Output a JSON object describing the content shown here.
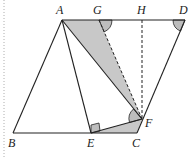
{
  "diagram": {
    "points": {
      "A": {
        "label": "A",
        "x": 62,
        "y": 20
      },
      "G": {
        "label": "G",
        "x": 99,
        "y": 20
      },
      "H": {
        "label": "H",
        "x": 142,
        "y": 20
      },
      "D": {
        "label": "D",
        "x": 185,
        "y": 20
      },
      "B": {
        "label": "B",
        "x": 13,
        "y": 133
      },
      "E": {
        "label": "E",
        "x": 91,
        "y": 133
      },
      "C": {
        "label": "C",
        "x": 137,
        "y": 133
      },
      "F": {
        "label": "F",
        "x": 142,
        "y": 119
      }
    },
    "labels": {
      "A": "A",
      "G": "G",
      "H": "H",
      "D": "D",
      "B": "B",
      "E": "E",
      "C": "C",
      "F": "F"
    },
    "colors": {
      "line": "#222222",
      "shade": "#c8c8c8",
      "angle_mark": "#bdbdbd"
    }
  }
}
